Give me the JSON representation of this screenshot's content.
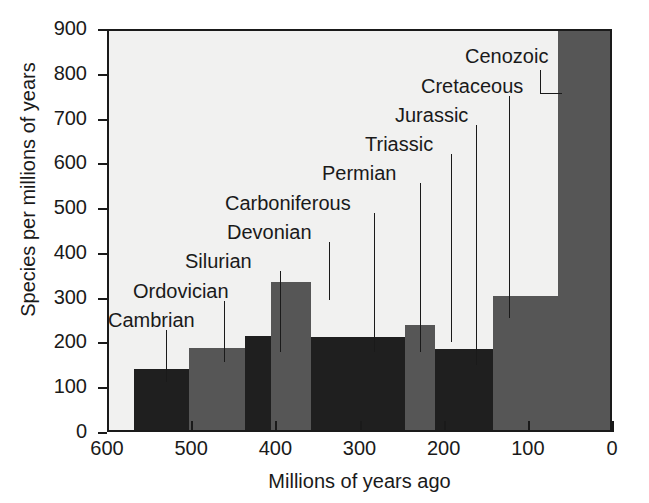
{
  "chart_data": {
    "type": "bar",
    "title": "",
    "subtitle": "",
    "xlabel": "Millions of years ago",
    "ylabel": "Species per millions of years",
    "xlim": [
      600,
      0
    ],
    "ylim": [
      0,
      900
    ],
    "x_ticks": [
      "600",
      "500",
      "400",
      "300",
      "200",
      "100",
      "0"
    ],
    "x_tick_values": [
      600,
      500,
      400,
      300,
      200,
      100,
      0
    ],
    "y_ticks": [
      "0",
      "100",
      "200",
      "300",
      "400",
      "500",
      "600",
      "700",
      "800",
      "900"
    ],
    "y_tick_values": [
      0,
      100,
      200,
      300,
      400,
      500,
      600,
      700,
      800,
      900
    ],
    "grid": false,
    "legend": "none",
    "x_axis_direction": "reversed",
    "categories": [
      "Cambrian",
      "Ordovician",
      "Silurian",
      "Devonian",
      "Carboniferous",
      "Permian",
      "Triassic",
      "Jurassic",
      "Cretaceous",
      "Cenozoic"
    ],
    "values": [
      136,
      184,
      211,
      331,
      208,
      208,
      234,
      181,
      300,
      900
    ],
    "bars": [
      {
        "label": "Cambrian",
        "value": 136,
        "x_start": 570,
        "x_end": 505,
        "shade": "dark"
      },
      {
        "label": "Ordovician",
        "value": 184,
        "x_start": 505,
        "x_end": 438,
        "shade": "gray"
      },
      {
        "label": "Silurian",
        "value": 211,
        "x_start": 438,
        "x_end": 408,
        "shade": "dark"
      },
      {
        "label": "Devonian",
        "value": 331,
        "x_start": 408,
        "x_end": 360,
        "shade": "gray"
      },
      {
        "label": "Carboniferous",
        "value": 208,
        "x_start": 360,
        "x_end": 286,
        "shade": "dark"
      },
      {
        "label": "Permian",
        "value": 208,
        "x_start": 286,
        "x_end": 248,
        "shade": "dark"
      },
      {
        "label": "Triassic",
        "value": 234,
        "x_start": 248,
        "x_end": 213,
        "shade": "gray"
      },
      {
        "label": "Jurassic",
        "value": 181,
        "x_start": 213,
        "x_end": 144,
        "shade": "dark"
      },
      {
        "label": "Cretaceous",
        "value": 300,
        "x_start": 144,
        "x_end": 66,
        "shade": "gray"
      },
      {
        "label": "Cenozoic",
        "value": 900,
        "x_start": 66,
        "x_end": 0,
        "shade": "gray"
      }
    ],
    "colors": {
      "dark_bar": "#1f1f1f",
      "gray_bar": "#565656",
      "plot_background": "#f1f1f0",
      "axis": "#1a1a1a",
      "page_background": "#ffffff"
    }
  },
  "annotations": [
    {
      "text": "Cambrian",
      "label_left": 108,
      "label_top": 310,
      "leader_x": 166,
      "leader_top": 330,
      "leader_bottom": 382
    },
    {
      "text": "Ordovician",
      "label_left": 133,
      "label_top": 281,
      "leader_x": 224,
      "leader_top": 301,
      "leader_bottom": 362
    },
    {
      "text": "Silurian",
      "label_left": 185,
      "label_top": 251,
      "leader_x": 280,
      "leader_top": 271,
      "leader_bottom": 352
    },
    {
      "text": "Devonian",
      "label_left": 227,
      "label_top": 222,
      "leader_x": 329,
      "leader_top": 242,
      "leader_bottom": 300
    },
    {
      "text": "Carboniferous",
      "label_left": 225,
      "label_top": 193,
      "leader_x": 374,
      "leader_top": 213,
      "leader_bottom": 352
    },
    {
      "text": "Permian",
      "label_left": 322,
      "label_top": 163,
      "leader_x": 420,
      "leader_top": 183,
      "leader_bottom": 352
    },
    {
      "text": "Triassic",
      "label_left": 365,
      "label_top": 134,
      "leader_x": 451,
      "leader_top": 154,
      "leader_bottom": 342
    },
    {
      "text": "Jurassic",
      "label_left": 395,
      "label_top": 105,
      "leader_x": 476,
      "leader_top": 125,
      "leader_bottom": 365
    },
    {
      "text": "Cretaceous",
      "label_left": 421,
      "label_top": 76,
      "leader_x": 509,
      "leader_top": 96,
      "leader_bottom": 318
    },
    {
      "text": "Cenozoic",
      "label_left": 465,
      "label_top": 46,
      "leader_x": 540,
      "leader_top": 70,
      "leader_bottom": 93,
      "elbow_left": 540,
      "elbow_top": 93,
      "elbow_width": 22
    }
  ]
}
